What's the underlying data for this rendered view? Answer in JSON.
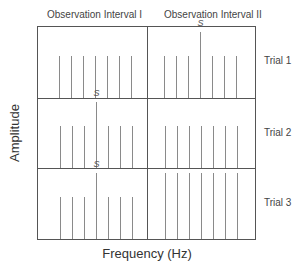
{
  "diagram": {
    "columns": [
      {
        "title": "Observation Interval I"
      },
      {
        "title": "Observation Interval II"
      }
    ],
    "rows": [
      {
        "label": "Trial 1"
      },
      {
        "label": "Trial 2"
      },
      {
        "label": "Trial 3"
      }
    ],
    "y_axis_label": "Amplitude",
    "x_axis_label": "Frequency (Hz)",
    "signal_marker": "S",
    "line_color": "#8a8a8a",
    "frame_color": "#555555",
    "panels": [
      {
        "row": 1,
        "col": 1,
        "bars": [
          1,
          1,
          1,
          1,
          1,
          1,
          1
        ],
        "signal_index": null
      },
      {
        "row": 1,
        "col": 2,
        "bars": [
          1,
          1,
          1,
          1.6,
          1,
          1,
          1
        ],
        "signal_index": 3
      },
      {
        "row": 2,
        "col": 1,
        "bars": [
          1,
          1,
          1,
          1.6,
          1,
          1,
          1
        ],
        "signal_index": 3
      },
      {
        "row": 2,
        "col": 2,
        "bars": [
          1,
          1,
          1,
          1,
          1,
          1,
          1
        ],
        "signal_index": null
      },
      {
        "row": 3,
        "col": 1,
        "bars": [
          1,
          1,
          1,
          1.6,
          1,
          1,
          1
        ],
        "signal_index": 3
      },
      {
        "row": 3,
        "col": 2,
        "bars": [
          2.1,
          2.1,
          2.1,
          2.1,
          2.1,
          2.1,
          2.1
        ],
        "signal_index": null
      }
    ]
  }
}
